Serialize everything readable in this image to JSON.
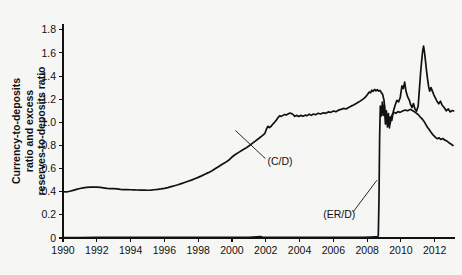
{
  "chart_data": {
    "type": "line",
    "title": "",
    "xlabel": "",
    "ylabel": "Currency-to-deposits ratio and excess reserves-to-deposits ratio",
    "ylabel_lines": [
      "Currency-to-deposits",
      "ratio and excess",
      "reserves-to-deposits ratio"
    ],
    "xlim": [
      1990,
      2013.2
    ],
    "ylim": [
      0,
      1.85
    ],
    "grid": false,
    "legend_position": "none",
    "xticks": [
      1990,
      1992,
      1994,
      1996,
      1998,
      2000,
      2002,
      2004,
      2006,
      2008,
      2010,
      2012
    ],
    "xtick_labels": [
      "1990",
      "1992",
      "1994",
      "1996",
      "1998",
      "2000",
      "2002",
      "2004",
      "2006",
      "2008",
      "2010",
      "2012"
    ],
    "yticks": [
      0,
      0.2,
      0.4,
      0.6,
      0.8,
      1.0,
      1.2,
      1.4,
      1.6,
      1.8
    ],
    "ytick_labels": [
      "0",
      "0.2",
      "0.4",
      "0.6",
      "0.8",
      "1.0",
      "1.2",
      "1.4",
      "1.6",
      "1.8"
    ],
    "colors": {
      "line": "#111111",
      "axis": "#111111",
      "background": "#f6f6f4"
    },
    "annotations": [
      {
        "name": "cd-label",
        "text": "(C/D)",
        "x": 2002.1,
        "y": 0.66,
        "leader_to_x": 2000.2,
        "leader_to_y": 0.93
      },
      {
        "name": "erd-label",
        "text": "(ER/D)",
        "x": 2005.4,
        "y": 0.2,
        "leader_to_x": 2008.58,
        "leader_to_y": 0.5
      }
    ],
    "series": [
      {
        "name": "(C/D)",
        "label": "Currency-to-deposits ratio",
        "points": [
          [
            1990.0,
            0.4
          ],
          [
            1990.2,
            0.398
          ],
          [
            1990.4,
            0.404
          ],
          [
            1990.6,
            0.412
          ],
          [
            1990.8,
            0.42
          ],
          [
            1991.0,
            0.428
          ],
          [
            1991.2,
            0.434
          ],
          [
            1991.4,
            0.437
          ],
          [
            1991.6,
            0.44
          ],
          [
            1991.8,
            0.441
          ],
          [
            1992.0,
            0.44
          ],
          [
            1992.2,
            0.437
          ],
          [
            1992.4,
            0.433
          ],
          [
            1992.6,
            0.429
          ],
          [
            1992.8,
            0.427
          ],
          [
            1993.0,
            0.426
          ],
          [
            1993.2,
            0.424
          ],
          [
            1993.4,
            0.421
          ],
          [
            1993.6,
            0.419
          ],
          [
            1993.8,
            0.418
          ],
          [
            1994.0,
            0.417
          ],
          [
            1994.2,
            0.416
          ],
          [
            1994.4,
            0.415
          ],
          [
            1994.6,
            0.414
          ],
          [
            1994.8,
            0.414
          ],
          [
            1995.0,
            0.413
          ],
          [
            1995.2,
            0.414
          ],
          [
            1995.4,
            0.417
          ],
          [
            1995.6,
            0.42
          ],
          [
            1995.8,
            0.424
          ],
          [
            1996.0,
            0.429
          ],
          [
            1996.2,
            0.436
          ],
          [
            1996.4,
            0.444
          ],
          [
            1996.6,
            0.452
          ],
          [
            1996.8,
            0.46
          ],
          [
            1997.0,
            0.47
          ],
          [
            1997.2,
            0.48
          ],
          [
            1997.4,
            0.49
          ],
          [
            1997.6,
            0.5
          ],
          [
            1997.8,
            0.512
          ],
          [
            1998.0,
            0.524
          ],
          [
            1998.2,
            0.537
          ],
          [
            1998.4,
            0.551
          ],
          [
            1998.6,
            0.565
          ],
          [
            1998.8,
            0.58
          ],
          [
            1999.0,
            0.598
          ],
          [
            1999.2,
            0.616
          ],
          [
            1999.4,
            0.635
          ],
          [
            1999.6,
            0.652
          ],
          [
            1999.8,
            0.672
          ],
          [
            2000.0,
            0.7
          ],
          [
            2000.2,
            0.722
          ],
          [
            2000.4,
            0.74
          ],
          [
            2000.6,
            0.758
          ],
          [
            2000.8,
            0.775
          ],
          [
            2001.0,
            0.795
          ],
          [
            2001.2,
            0.818
          ],
          [
            2001.4,
            0.84
          ],
          [
            2001.6,
            0.862
          ],
          [
            2001.8,
            0.885
          ],
          [
            2001.95,
            0.905
          ],
          [
            2002.05,
            0.944
          ],
          [
            2002.12,
            0.966
          ],
          [
            2002.22,
            0.955
          ],
          [
            2002.32,
            0.966
          ],
          [
            2002.42,
            0.985
          ],
          [
            2002.52,
            1.0
          ],
          [
            2002.62,
            1.018
          ],
          [
            2002.72,
            1.04
          ],
          [
            2002.82,
            1.056
          ],
          [
            2002.92,
            1.052
          ],
          [
            2003.02,
            1.06
          ],
          [
            2003.12,
            1.068
          ],
          [
            2003.22,
            1.063
          ],
          [
            2003.32,
            1.073
          ],
          [
            2003.45,
            1.08
          ],
          [
            2003.6,
            1.07
          ],
          [
            2003.72,
            1.052
          ],
          [
            2003.82,
            1.06
          ],
          [
            2003.95,
            1.051
          ],
          [
            2004.08,
            1.06
          ],
          [
            2004.2,
            1.052
          ],
          [
            2004.33,
            1.062
          ],
          [
            2004.45,
            1.058
          ],
          [
            2004.58,
            1.07
          ],
          [
            2004.7,
            1.06
          ],
          [
            2004.82,
            1.072
          ],
          [
            2004.95,
            1.066
          ],
          [
            2005.1,
            1.078
          ],
          [
            2005.25,
            1.072
          ],
          [
            2005.4,
            1.082
          ],
          [
            2005.55,
            1.078
          ],
          [
            2005.7,
            1.09
          ],
          [
            2005.85,
            1.086
          ],
          [
            2006.0,
            1.098
          ],
          [
            2006.15,
            1.092
          ],
          [
            2006.3,
            1.105
          ],
          [
            2006.45,
            1.112
          ],
          [
            2006.6,
            1.12
          ],
          [
            2006.75,
            1.115
          ],
          [
            2006.9,
            1.128
          ],
          [
            2007.05,
            1.14
          ],
          [
            2007.2,
            1.15
          ],
          [
            2007.35,
            1.162
          ],
          [
            2007.5,
            1.175
          ],
          [
            2007.65,
            1.19
          ],
          [
            2007.8,
            1.205
          ],
          [
            2007.92,
            1.222
          ],
          [
            2008.02,
            1.24
          ],
          [
            2008.12,
            1.262
          ],
          [
            2008.2,
            1.255
          ],
          [
            2008.28,
            1.278
          ],
          [
            2008.36,
            1.268
          ],
          [
            2008.44,
            1.285
          ],
          [
            2008.52,
            1.272
          ],
          [
            2008.6,
            1.282
          ],
          [
            2008.68,
            1.27
          ],
          [
            2008.76,
            1.276
          ],
          [
            2008.84,
            1.258
          ],
          [
            2008.92,
            1.24
          ],
          [
            2009.0,
            1.19
          ],
          [
            2009.04,
            1.118
          ],
          [
            2009.08,
            1.06
          ],
          [
            2009.12,
            1.006
          ],
          [
            2009.16,
            1.052
          ],
          [
            2009.2,
            0.99
          ],
          [
            2009.24,
            1.048
          ],
          [
            2009.28,
            0.975
          ],
          [
            2009.32,
            1.04
          ],
          [
            2009.36,
            0.986
          ],
          [
            2009.42,
            1.042
          ],
          [
            2009.5,
            1.072
          ],
          [
            2009.6,
            1.086
          ],
          [
            2009.7,
            1.078
          ],
          [
            2009.82,
            1.092
          ],
          [
            2009.95,
            1.086
          ],
          [
            2010.1,
            1.098
          ],
          [
            2010.25,
            1.106
          ],
          [
            2010.4,
            1.1
          ],
          [
            2010.55,
            1.112
          ],
          [
            2010.7,
            1.1
          ],
          [
            2010.85,
            1.086
          ],
          [
            2011.0,
            1.07
          ],
          [
            2011.12,
            1.05
          ],
          [
            2011.24,
            1.032
          ],
          [
            2011.36,
            1.01
          ],
          [
            2011.46,
            0.985
          ],
          [
            2011.56,
            0.96
          ],
          [
            2011.66,
            0.94
          ],
          [
            2011.76,
            0.918
          ],
          [
            2011.86,
            0.898
          ],
          [
            2011.96,
            0.882
          ],
          [
            2012.06,
            0.868
          ],
          [
            2012.16,
            0.858
          ],
          [
            2012.26,
            0.866
          ],
          [
            2012.36,
            0.852
          ],
          [
            2012.48,
            0.86
          ],
          [
            2012.6,
            0.846
          ],
          [
            2012.72,
            0.838
          ],
          [
            2012.84,
            0.824
          ],
          [
            2012.96,
            0.812
          ],
          [
            2013.08,
            0.8
          ]
        ]
      },
      {
        "name": "(ER/D)",
        "label": "Excess reserves-to-deposits ratio",
        "points": [
          [
            1990.0,
            0.004
          ],
          [
            1991.0,
            0.004
          ],
          [
            1992.0,
            0.005
          ],
          [
            1993.0,
            0.005
          ],
          [
            1994.0,
            0.005
          ],
          [
            1995.0,
            0.005
          ],
          [
            1996.0,
            0.006
          ],
          [
            1997.0,
            0.005
          ],
          [
            1998.0,
            0.005
          ],
          [
            1999.0,
            0.006
          ],
          [
            2000.0,
            0.005
          ],
          [
            2001.0,
            0.006
          ],
          [
            2001.7,
            0.012
          ],
          [
            2001.8,
            0.006
          ],
          [
            2002.0,
            0.006
          ],
          [
            2003.0,
            0.005
          ],
          [
            2004.0,
            0.005
          ],
          [
            2005.0,
            0.005
          ],
          [
            2006.0,
            0.005
          ],
          [
            2007.0,
            0.005
          ],
          [
            2007.8,
            0.006
          ],
          [
            2008.2,
            0.008
          ],
          [
            2008.45,
            0.01
          ],
          [
            2008.58,
            0.01
          ],
          [
            2008.66,
            0.018
          ],
          [
            2008.7,
            0.32
          ],
          [
            2008.74,
            0.88
          ],
          [
            2008.78,
            1.14
          ],
          [
            2008.84,
            1.055
          ],
          [
            2008.9,
            1.175
          ],
          [
            2008.96,
            1.06
          ],
          [
            2009.02,
            1.15
          ],
          [
            2009.08,
            0.985
          ],
          [
            2009.14,
            1.1
          ],
          [
            2009.2,
            0.96
          ],
          [
            2009.26,
            1.075
          ],
          [
            2009.32,
            0.952
          ],
          [
            2009.38,
            1.046
          ],
          [
            2009.46,
            1.016
          ],
          [
            2009.56,
            1.1
          ],
          [
            2009.66,
            1.15
          ],
          [
            2009.76,
            1.19
          ],
          [
            2009.86,
            1.176
          ],
          [
            2009.96,
            1.215
          ],
          [
            2010.06,
            1.316
          ],
          [
            2010.14,
            1.292
          ],
          [
            2010.22,
            1.348
          ],
          [
            2010.3,
            1.268
          ],
          [
            2010.4,
            1.22
          ],
          [
            2010.5,
            1.19
          ],
          [
            2010.58,
            1.15
          ],
          [
            2010.66,
            1.128
          ],
          [
            2010.74,
            1.162
          ],
          [
            2010.82,
            1.12
          ],
          [
            2010.92,
            1.096
          ],
          [
            2011.02,
            1.14
          ],
          [
            2011.1,
            1.3
          ],
          [
            2011.16,
            1.42
          ],
          [
            2011.22,
            1.52
          ],
          [
            2011.28,
            1.61
          ],
          [
            2011.34,
            1.658
          ],
          [
            2011.4,
            1.6
          ],
          [
            2011.46,
            1.52
          ],
          [
            2011.52,
            1.44
          ],
          [
            2011.58,
            1.37
          ],
          [
            2011.64,
            1.31
          ],
          [
            2011.7,
            1.27
          ],
          [
            2011.78,
            1.3
          ],
          [
            2011.86,
            1.27
          ],
          [
            2011.94,
            1.24
          ],
          [
            2012.04,
            1.21
          ],
          [
            2012.14,
            1.18
          ],
          [
            2012.24,
            1.16
          ],
          [
            2012.34,
            1.182
          ],
          [
            2012.44,
            1.148
          ],
          [
            2012.56,
            1.128
          ],
          [
            2012.68,
            1.1
          ],
          [
            2012.8,
            1.116
          ],
          [
            2012.92,
            1.09
          ],
          [
            2013.04,
            1.102
          ],
          [
            2013.12,
            1.098
          ]
        ]
      }
    ]
  }
}
